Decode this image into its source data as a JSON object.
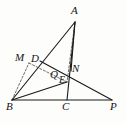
{
  "figure": {
    "kind": "geometry-diagram",
    "width": 126,
    "height": 123,
    "stroke_color": "#1a1a1a",
    "dash_color": "#4a4a4a",
    "background": "#fdfdfc",
    "points": [
      {
        "id": "A",
        "label": "A",
        "x": 75,
        "y": 22,
        "label_x": 71,
        "label_y": 5,
        "size": "normal"
      },
      {
        "id": "M",
        "label": "M",
        "x": 29,
        "y": 63,
        "label_x": 15,
        "label_y": 52,
        "size": "normal"
      },
      {
        "id": "D",
        "label": "D",
        "x": 40,
        "y": 61,
        "label_x": 31,
        "label_y": 53,
        "size": "normal"
      },
      {
        "id": "Q",
        "label": "Q",
        "x": 61,
        "y": 75,
        "label_x": 50,
        "label_y": 69,
        "size": "normal"
      },
      {
        "id": "E",
        "label": "E",
        "x": 67,
        "y": 82,
        "label_x": 59,
        "label_y": 75,
        "size": "sm"
      },
      {
        "id": "N",
        "label": "N",
        "x": 71,
        "y": 71,
        "label_x": 72,
        "label_y": 63,
        "size": "normal"
      },
      {
        "id": "B",
        "label": "B",
        "x": 12,
        "y": 100,
        "label_x": 6,
        "label_y": 101,
        "size": "normal"
      },
      {
        "id": "C",
        "label": "C",
        "x": 67,
        "y": 100,
        "label_x": 62,
        "label_y": 101,
        "size": "normal"
      },
      {
        "id": "P",
        "label": "P",
        "x": 112,
        "y": 100,
        "label_x": 110,
        "label_y": 101,
        "size": "normal"
      }
    ],
    "segments": [
      {
        "name": "segment-B-P",
        "from": "B",
        "to": "P",
        "style": "solid"
      },
      {
        "name": "segment-B-A",
        "from": "B",
        "to": "A",
        "style": "solid"
      },
      {
        "name": "segment-A-C",
        "from": "A",
        "to": "C",
        "style": "solid"
      },
      {
        "name": "segment-D-P",
        "from": "D",
        "to": "P",
        "style": "solid"
      },
      {
        "name": "segment-B-M",
        "from": "B",
        "to": "M",
        "style": "dashed"
      },
      {
        "name": "segment-M-E",
        "from": "M",
        "to": "E",
        "style": "dashed"
      },
      {
        "name": "segment-A-B2",
        "from": "A",
        "to": "E",
        "style": "dashed"
      },
      {
        "name": "segment-E-B",
        "from": "E",
        "to": "B",
        "style": "solid"
      },
      {
        "name": "segment-A-N",
        "from": "A",
        "to": "N",
        "style": "solid"
      }
    ]
  }
}
